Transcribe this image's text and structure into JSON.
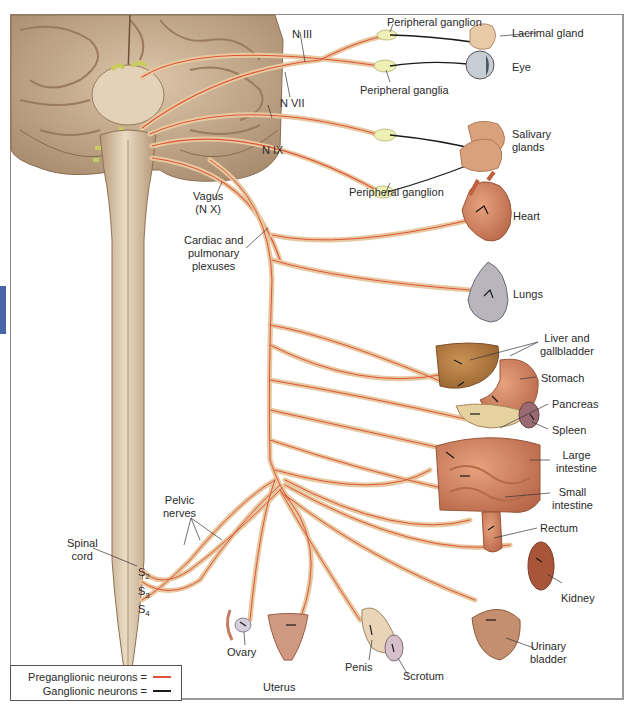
{
  "diagram": {
    "colors": {
      "preganglionic": "#e0533a",
      "ganglionic": "#1a1a1a",
      "nerve_sheath": "#e7c9a0",
      "brain": "#cdb497",
      "spinal_cord": "#d8c2a2",
      "accent_tab": "#4a64a8"
    },
    "cranial_labels": {
      "n3": "N III",
      "n7": "N VII",
      "n9": "N IX",
      "vagus_line1": "Vagus",
      "vagus_line2": "(N X)",
      "peripheral_ganglion_top": "Peripheral ganglion",
      "peripheral_ganglia": "Peripheral ganglia",
      "peripheral_ganglion_bottom": "Peripheral ganglion"
    },
    "organs": {
      "lacrimal": "Lacrimal gland",
      "eye": "Eye",
      "salivary_1": "Salivary",
      "salivary_2": "glands",
      "heart": "Heart",
      "lungs": "Lungs",
      "liver_1": "Liver and",
      "liver_2": "gallbladder",
      "stomach": "Stomach",
      "pancreas": "Pancreas",
      "spleen": "Spleen",
      "large_int_1": "Large",
      "large_int_2": "intestine",
      "small_int_1": "Small",
      "small_int_2": "intestine",
      "rectum": "Rectum",
      "kidney": "Kidney",
      "bladder_1": "Urinary",
      "bladder_2": "bladder",
      "ovary": "Ovary",
      "uterus": "Uterus",
      "penis": "Penis",
      "scrotum": "Scrotum"
    },
    "plexus_labels": {
      "cardiac_1": "Cardiac and",
      "cardiac_2": "pulmonary",
      "cardiac_3": "plexuses",
      "pelvic_1": "Pelvic",
      "pelvic_2": "nerves"
    },
    "spinal_labels": {
      "spinal_1": "Spinal",
      "spinal_2": "cord",
      "s_letter": "S",
      "s2": "2",
      "s3": "3",
      "s4": "4"
    },
    "legend": {
      "preganglionic_label": "Preganglionic neurons =",
      "ganglionic_label": "Ganglionic neurons ="
    }
  }
}
